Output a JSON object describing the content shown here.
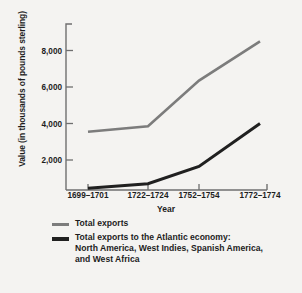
{
  "chart_data": {
    "type": "line",
    "title": "",
    "xlabel": "Year",
    "ylabel": "Value (in thousands of pounds sterling)",
    "categories": [
      "1699–1701",
      "1722–1724",
      "1752–1754",
      "1772–1774"
    ],
    "yticks": [
      "2,000",
      "4,000",
      "6,000",
      "8,000"
    ],
    "ytick_values": [
      2000,
      4000,
      6000,
      8000
    ],
    "ylim": [
      0,
      10000
    ],
    "grid": false,
    "legend_position": "below",
    "series": [
      {
        "name": "Total exports",
        "color": "#7c7c7c",
        "values": [
          3550,
          3850,
          6350,
          8500
        ]
      },
      {
        "name": "Total exports to the Atlantic economy: North America, West Indies, Spanish America, and West Africa",
        "color": "#202020",
        "values": [
          450,
          700,
          1650,
          4000
        ]
      }
    ]
  },
  "legend": {
    "items": [
      {
        "swatch": "total",
        "lines": [
          "Total exports"
        ]
      },
      {
        "swatch": "atlantic",
        "lines": [
          "Total exports to the Atlantic economy:",
          "North America, West Indies, Spanish America,",
          "and West Africa"
        ]
      }
    ]
  },
  "legend_line_1_1": "Total exports",
  "legend_line_2_1": "Total exports to the Atlantic economy:",
  "legend_line_2_2": "North America, West Indies, Spanish America,",
  "legend_line_2_3": "and West Africa"
}
